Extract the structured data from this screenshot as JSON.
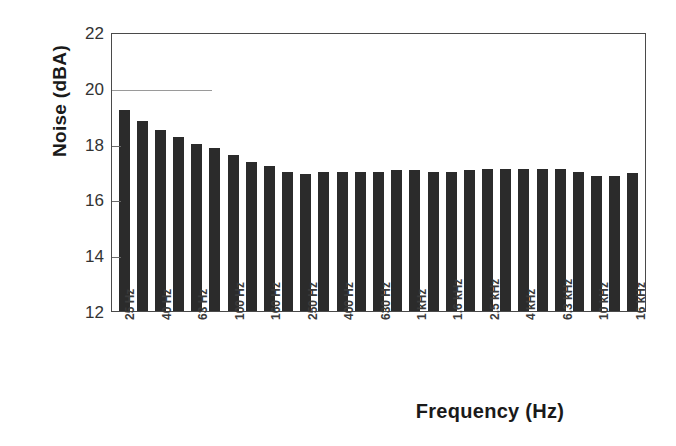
{
  "chart_data": {
    "type": "bar",
    "title": "",
    "xlabel": "Frequency (Hz)",
    "ylabel": "Noise (dBA)",
    "ylim": [
      12,
      22
    ],
    "yticks": [
      12,
      14,
      16,
      18,
      20,
      22
    ],
    "grid": false,
    "legend": "none",
    "bar_color": "#2b2b2b",
    "axis_color": "#4a4a4a",
    "categories": [
      "25 Hz",
      "31.5 Hz",
      "40 Hz",
      "50 Hz",
      "63 Hz",
      "80 Hz",
      "100 Hz",
      "125 Hz",
      "160 Hz",
      "200 Hz",
      "250 Hz",
      "315 Hz",
      "400 Hz",
      "500 Hz",
      "630 Hz",
      "800 Hz",
      "1 kHz",
      "1.25 kHz",
      "1.6 kHz",
      "2 kHz",
      "2.5 kHz",
      "3.15 kHz",
      "4 kHz",
      "5 kHz",
      "6.3 kHz",
      "8 kHz",
      "10 kHz",
      "12.5 kHz",
      "16 kHz"
    ],
    "tick_labels": [
      "25 Hz",
      "40 Hz",
      "63 Hz",
      "100 Hz",
      "160 Hz",
      "250 Hz",
      "400 Hz",
      "630 Hz",
      "1 kHz",
      "1.6 kHz",
      "2.5 kHz",
      "4 kHz",
      "6.3 kHz",
      "10 kHz",
      "16 kHz"
    ],
    "values": [
      19.2,
      18.8,
      18.5,
      18.25,
      18.0,
      17.85,
      17.6,
      17.35,
      17.2,
      17.0,
      16.9,
      17.0,
      17.0,
      17.0,
      17.0,
      17.05,
      17.05,
      17.0,
      17.0,
      17.05,
      17.1,
      17.1,
      17.1,
      17.1,
      17.1,
      17.0,
      16.85,
      16.85,
      16.95
    ]
  }
}
